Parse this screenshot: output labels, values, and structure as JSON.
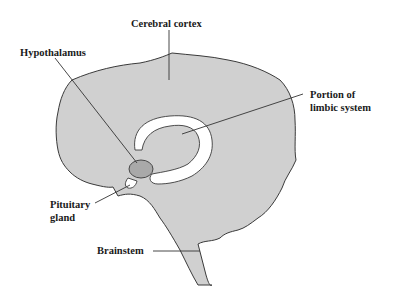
{
  "diagram": {
    "type": "anatomical-sagittal-brain",
    "colors": {
      "background": "#ffffff",
      "brain_fill": "#d0d0d0",
      "outline": "#3a3a3a",
      "limbic_fill": "#ffffff",
      "hypothalamus_fill": "#a9a9a9",
      "label_text": "#1a1a1a"
    },
    "labels": {
      "cerebral_cortex": "Cerebral cortex",
      "hypothalamus": "Hypothalamus",
      "limbic_line1": "Portion of",
      "limbic_line2": "limbic system",
      "pituitary_line1": "Pituitary",
      "pituitary_line2": "gland",
      "brainstem": "Brainstem"
    }
  }
}
